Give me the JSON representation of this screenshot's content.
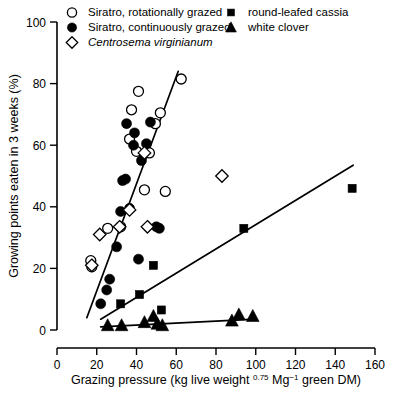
{
  "chart_data": {
    "type": "scatter",
    "title": "",
    "xlabel": "Grazing pressure (kg live weight 0.75 Mg-1 green DM)",
    "xlabel_parts": {
      "a": "Grazing pressure (kg live weight ",
      "sup1": "0.75",
      "b": " Mg",
      "sup2": "−1",
      "c": " green DM)"
    },
    "ylabel": "Growing points eaten in 3 weeks (%)",
    "xlim": [
      0,
      160
    ],
    "ylim": [
      0,
      100
    ],
    "xticks": [
      0,
      20,
      40,
      60,
      80,
      100,
      120,
      140,
      160
    ],
    "yticks": [
      0,
      20,
      40,
      60,
      80,
      100
    ],
    "grid": false,
    "legend_position": "top",
    "legend": [
      {
        "label": "Siratro, rotationally grazed",
        "marker": "open-circle",
        "italic": false
      },
      {
        "label": "Siratro, continuously grazed",
        "marker": "filled-circle",
        "italic": false
      },
      {
        "label": "Centrosema virginianum",
        "marker": "open-diamond",
        "italic": true
      },
      {
        "label": "round-leafed cassia",
        "marker": "filled-square",
        "italic": false
      },
      {
        "label": "white clover",
        "marker": "filled-triangle",
        "italic": false
      }
    ],
    "series": [
      {
        "name": "Siratro, rotationally grazed",
        "marker": "open-circle",
        "points": [
          [
            17.0,
            22.5
          ],
          [
            17.5,
            20.5
          ],
          [
            25.5,
            33.0
          ],
          [
            32.0,
            33.5
          ],
          [
            36.5,
            62.0
          ],
          [
            37.5,
            71.5
          ],
          [
            40.0,
            58.0
          ],
          [
            41.0,
            77.5
          ],
          [
            44.0,
            45.5
          ],
          [
            46.5,
            57.5
          ],
          [
            49.5,
            67.0
          ],
          [
            52.0,
            70.5
          ],
          [
            54.5,
            45.0
          ],
          [
            62.5,
            81.5
          ]
        ]
      },
      {
        "name": "Siratro, continuously grazed",
        "marker": "filled-circle",
        "points": [
          [
            22.0,
            8.5
          ],
          [
            25.0,
            13.0
          ],
          [
            26.5,
            16.5
          ],
          [
            30.0,
            27.0
          ],
          [
            32.0,
            38.5
          ],
          [
            33.0,
            48.5
          ],
          [
            34.5,
            49.0
          ],
          [
            35.0,
            67.0
          ],
          [
            36.5,
            39.5
          ],
          [
            38.5,
            60.0
          ],
          [
            39.0,
            64.0
          ],
          [
            41.0,
            23.0
          ],
          [
            42.5,
            55.0
          ],
          [
            45.0,
            60.5
          ],
          [
            47.0,
            67.5
          ],
          [
            50.0,
            33.5
          ],
          [
            51.5,
            33.0
          ]
        ]
      },
      {
        "name": "Centrosema virginianum",
        "marker": "open-diamond",
        "points": [
          [
            17.5,
            21.0
          ],
          [
            21.5,
            31.0
          ],
          [
            31.5,
            33.5
          ],
          [
            36.5,
            39.0
          ],
          [
            44.0,
            57.5
          ],
          [
            45.5,
            33.5
          ],
          [
            83.0,
            50.0
          ]
        ]
      },
      {
        "name": "round-leafed cassia",
        "marker": "filled-square",
        "points": [
          [
            32.0,
            8.5
          ],
          [
            41.5,
            11.5
          ],
          [
            48.5,
            21.0
          ],
          [
            52.5,
            6.5
          ],
          [
            94.0,
            33.0
          ],
          [
            148.5,
            46.0
          ]
        ]
      },
      {
        "name": "white clover",
        "marker": "filled-triangle",
        "points": [
          [
            25.5,
            1.5
          ],
          [
            32.5,
            1.5
          ],
          [
            44.0,
            2.5
          ],
          [
            48.5,
            4.5
          ],
          [
            50.5,
            2.0
          ],
          [
            53.0,
            1.5
          ],
          [
            88.0,
            3.0
          ],
          [
            91.5,
            5.0
          ],
          [
            98.5,
            4.5
          ]
        ]
      }
    ],
    "fit_lines": [
      {
        "name": "siratro-fit",
        "x1": 15.0,
        "y1": 4.0,
        "x2": 61.0,
        "y2": 84.0
      },
      {
        "name": "cassia-fit",
        "x1": 22.0,
        "y1": 3.5,
        "x2": 149.0,
        "y2": 53.5
      },
      {
        "name": "clover-fit",
        "x1": 22.0,
        "y1": 1.0,
        "x2": 100.0,
        "y2": 3.5
      }
    ]
  }
}
